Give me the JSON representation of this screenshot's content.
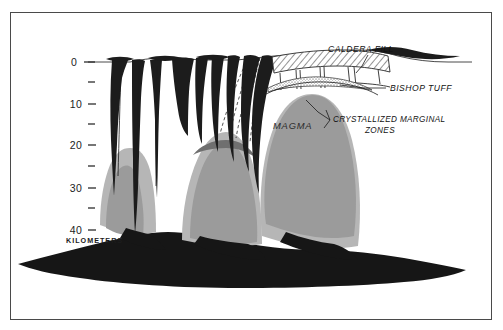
{
  "figure": {
    "depth_unit_label": "KILOMETERS"
  },
  "axis": {
    "name": "depth-axis",
    "unit": "KILOMETERS",
    "orientation": "vertical",
    "direction": "downward",
    "major_ticks": [
      "0",
      "10",
      "20",
      "30",
      "40"
    ],
    "minor_ticks": [
      "5",
      "15",
      "25",
      "35"
    ],
    "range_km": [
      0,
      40
    ]
  },
  "labels": {
    "caldera_fill": "CALDERA FILL",
    "bishop_tuff": "BISHOP TUFF",
    "crystallized_line1": "CRYSTALLIZED  MARGINAL",
    "crystallized_line2": "ZONES",
    "magma": "MAGMA"
  },
  "colors": {
    "background": "#ffffff",
    "frame": "#4a4a4a",
    "dark_rock": "#1a1a1a",
    "magma_gray": "#9a9a9a",
    "margin_gray": "#b4b4b4",
    "ink": "#1c1c1c"
  },
  "legend_units": {
    "dark": "solid basement / dark intrusive rock",
    "medium_gray": "magma",
    "light_gray": "crystallized marginal zones",
    "hatched": "caldera fill",
    "stippled": "Bishop Tuff"
  }
}
